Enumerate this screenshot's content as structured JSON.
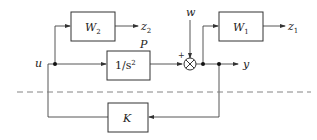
{
  "diagram": {
    "type": "block-diagram",
    "blocks": [
      {
        "id": "W2",
        "label": "W",
        "subscript": "2"
      },
      {
        "id": "P",
        "label": "1/s",
        "superscript": "2",
        "name_label": "P"
      },
      {
        "id": "W1",
        "label": "W",
        "subscript": "1"
      },
      {
        "id": "K",
        "label": "K"
      }
    ],
    "signals": {
      "u": "u",
      "w": "w",
      "y": "y",
      "z1_base": "z",
      "z1_sub": "1",
      "z2_base": "z",
      "z2_sub": "2"
    },
    "summing_junction": {
      "symbol": "⊗",
      "sign_left": "+"
    },
    "separator": "dashed-line"
  }
}
